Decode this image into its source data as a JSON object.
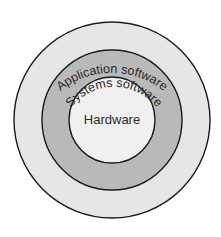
{
  "diagram": {
    "type": "concentric-circles",
    "center": {
      "x": 112,
      "y": 120
    },
    "layers": [
      {
        "id": "application",
        "label": "Application software",
        "radius": 98,
        "fill": "#e6e6e6",
        "label_radius": 82,
        "label_position": "curved-top"
      },
      {
        "id": "systems",
        "label": "Systems software",
        "radius": 70,
        "fill": "#b9b9b9",
        "label_radius": 55,
        "label_position": "curved-top"
      },
      {
        "id": "hardware",
        "label": "Hardware",
        "radius": 43,
        "fill": "#efefef",
        "label_position": "center"
      }
    ],
    "stroke_color": "#1a1a1a",
    "background": "#ffffff"
  }
}
